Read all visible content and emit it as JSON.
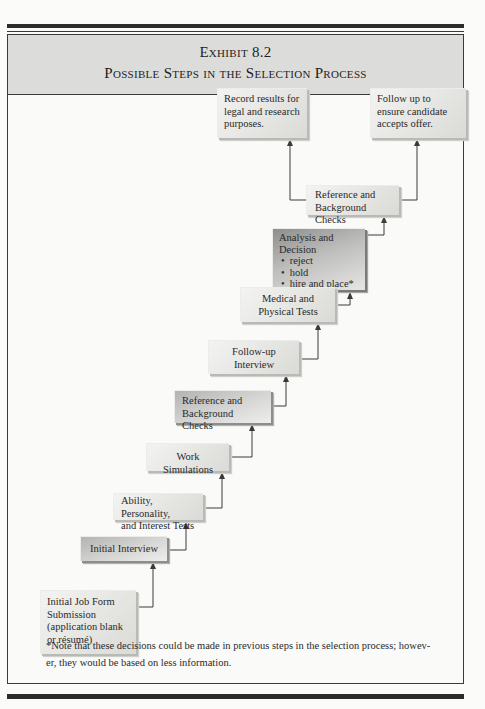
{
  "header": {
    "exhibit_label": "Exhibit 8.2",
    "title": "Possible Steps in the Selection Process"
  },
  "steps": [
    {
      "id": "initial-job-form",
      "lines": [
        "Initial Job Form",
        "Submission",
        "(application blank",
        "or résumé)"
      ]
    },
    {
      "id": "initial-interview",
      "lines": [
        "Initial Interview"
      ]
    },
    {
      "id": "ability-tests",
      "lines": [
        "Ability, Personality,",
        "and Interest Tests"
      ]
    },
    {
      "id": "work-simulations",
      "lines": [
        "Work Simulations"
      ]
    },
    {
      "id": "reference-checks-1",
      "lines": [
        "Reference and",
        "Background Checks"
      ]
    },
    {
      "id": "follow-up-interview",
      "lines": [
        "Follow-up",
        "Interview"
      ]
    },
    {
      "id": "medical-tests",
      "lines": [
        "Medical and",
        "Physical Tests"
      ]
    },
    {
      "id": "analysis-decision",
      "title_lines": [
        "Analysis and",
        "Decision"
      ],
      "bullets": [
        "reject",
        "hold",
        "hire and place*"
      ]
    },
    {
      "id": "reference-checks-2",
      "lines": [
        "Reference and",
        "Background Checks"
      ]
    },
    {
      "id": "record-results",
      "lines": [
        "Record results for",
        "legal and research",
        "purposes."
      ]
    },
    {
      "id": "follow-up-offer",
      "lines": [
        "Follow up to",
        "ensure candidate",
        "accepts offer."
      ]
    }
  ],
  "footnote": {
    "line1": "*Note that these decisions could be made in previous steps in the selection process; howev-",
    "line2": "er, they would be based on less information."
  },
  "colors": {
    "header_band": "#dcdcda",
    "rule": "#2c2c2c",
    "box_light": "#e6e6e4",
    "box_dark": "#8e8e8c",
    "connector": "#3a3a3a"
  }
}
